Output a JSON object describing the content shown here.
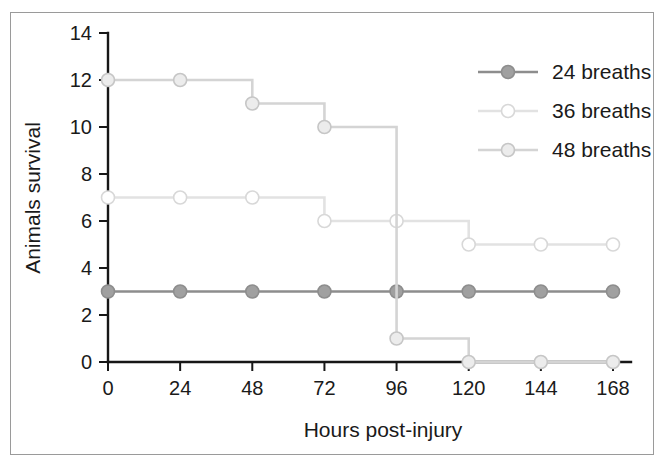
{
  "figure": {
    "background_color": "#ffffff",
    "frame_color": "#9a9a9a"
  },
  "chart_data": {
    "type": "line",
    "subtype": "step-after survival curve",
    "title": "",
    "xlabel": "Hours post-injury",
    "ylabel": "Animals survival",
    "x": [
      0,
      24,
      48,
      72,
      96,
      120,
      144,
      168
    ],
    "xticklabels": [
      "0",
      "24",
      "48",
      "72",
      "96",
      "120",
      "144",
      "168"
    ],
    "yticklabels": [
      "0",
      "2",
      "4",
      "6",
      "8",
      "10",
      "12",
      "14"
    ],
    "yticks": [
      0,
      2,
      4,
      6,
      8,
      10,
      12,
      14
    ],
    "xlim": [
      0,
      168
    ],
    "ylim": [
      0,
      14
    ],
    "grid": false,
    "legend_position": "top-right",
    "series": [
      {
        "name": "24 breaths",
        "values": [
          3,
          3,
          3,
          3,
          3,
          3,
          3,
          3
        ],
        "line_color": "#8d8d8d",
        "marker_fill": "#a0a0a0",
        "marker_edge": "#8d8d8d",
        "marker": "filled-circle"
      },
      {
        "name": "36 breaths",
        "values": [
          7,
          7,
          7,
          6,
          6,
          5,
          5,
          5
        ],
        "line_color": "#e2e2e2",
        "marker_fill": "#ffffff",
        "marker_edge": "#d8d8d8",
        "marker": "open-circle"
      },
      {
        "name": "48 breaths",
        "values": [
          12,
          12,
          11,
          10,
          1,
          0,
          0,
          0
        ],
        "line_color": "#d4d4d4",
        "marker_fill": "#ececec",
        "marker_edge": "#c6c6c6",
        "marker": "light-circle"
      }
    ]
  },
  "legend": {
    "entries": [
      {
        "label": "24 breaths"
      },
      {
        "label": "36 breaths"
      },
      {
        "label": "48 breaths"
      }
    ]
  },
  "axes": {
    "x_title": "Hours post-injury",
    "y_title": "Animals survival"
  }
}
